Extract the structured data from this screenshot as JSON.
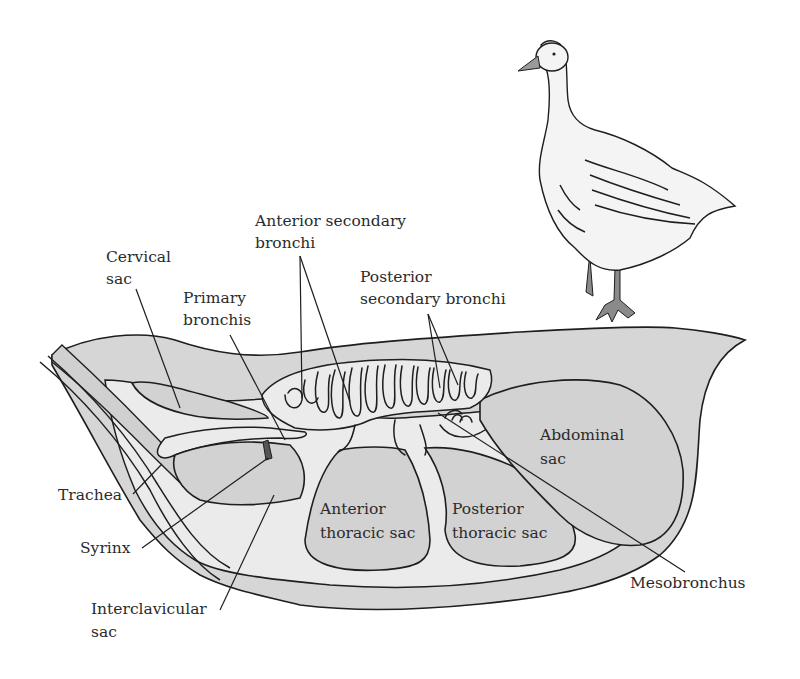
{
  "figure": {
    "colors": {
      "background": "#ffffff",
      "body_fill": "#d6d6d6",
      "light_fill": "#ebebeb",
      "outline": "#1e1e1e",
      "label_text": "#2b2b2b"
    }
  },
  "labels": {
    "cervical_sac": [
      "Cervical",
      "sac"
    ],
    "primary_bronchis": [
      "Primary",
      "bronchis"
    ],
    "anterior_secondary_bronchi": [
      "Anterior secondary",
      "bronchi"
    ],
    "posterior_secondary_bronchi": [
      "Posterior",
      "secondary bronchi"
    ],
    "abdominal_sac": [
      "Abdominal",
      "sac"
    ],
    "anterior_thoracic_sac": [
      "Anterior",
      "thoracic sac"
    ],
    "posterior_thoracic_sac": [
      "Posterior",
      "thoracic sac"
    ],
    "trachea": "Trachea",
    "syrinx": "Syrinx",
    "interclavicular_sac": [
      "Interclavicular",
      "sac"
    ],
    "mesobronchus": "Mesobronchus"
  },
  "icons": {
    "goose": "goose-illustration"
  }
}
